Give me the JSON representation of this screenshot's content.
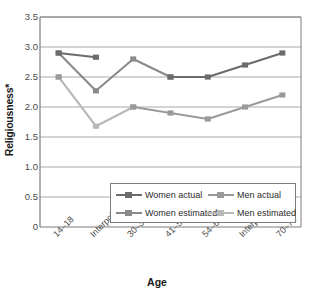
{
  "chart_data": {
    "type": "line",
    "title": "",
    "xlabel": "Age",
    "ylabel": "Religiousness*",
    "categories": [
      "14–18",
      "Interpolated",
      "30–38",
      "41–50",
      "54–61",
      "Interpolated",
      "70–79"
    ],
    "ylim": [
      0,
      3.5
    ],
    "yticks": [
      "3.5",
      "3.0",
      "2.5",
      "2.0",
      "1.5",
      "1.0",
      "0.5",
      "0"
    ],
    "ytick_values": [
      3.5,
      3.0,
      2.5,
      2.0,
      1.5,
      1.0,
      0.5,
      0
    ],
    "grid": "horizontal",
    "legend_position": "inside lower-right",
    "marker": "square",
    "series": [
      {
        "name": "Women actual",
        "color": "#6b6b6b",
        "values": [
          2.9,
          2.83,
          null,
          2.5,
          2.5,
          2.7,
          2.9
        ],
        "segments": [
          {
            "from": 0,
            "to": 1
          },
          {
            "from": 3,
            "to": 4
          },
          {
            "from": 4,
            "to": 5
          },
          {
            "from": 5,
            "to": 6
          }
        ]
      },
      {
        "name": "Men actual",
        "color": "#9a9a9a",
        "values": [
          2.5,
          null,
          2.0,
          1.9,
          1.8,
          2.0,
          2.2
        ],
        "segments": [
          {
            "from": 2,
            "to": 3
          },
          {
            "from": 3,
            "to": 4
          },
          {
            "from": 4,
            "to": 5
          },
          {
            "from": 5,
            "to": 6
          }
        ]
      },
      {
        "name": "Women estimated",
        "color": "#8a8a8a",
        "values": [
          2.9,
          2.27,
          2.8,
          2.5,
          null,
          null,
          null
        ],
        "segments": [
          {
            "from": 0,
            "to": 1
          },
          {
            "from": 1,
            "to": 2
          },
          {
            "from": 2,
            "to": 3
          }
        ]
      },
      {
        "name": "Men estimated",
        "color": "#b8b8b8",
        "values": [
          2.5,
          1.68,
          2.0,
          null,
          null,
          null,
          null
        ],
        "segments": [
          {
            "from": 0,
            "to": 1
          },
          {
            "from": 1,
            "to": 2
          }
        ]
      }
    ],
    "legend": [
      {
        "label": "Women actual",
        "color": "#6b6b6b"
      },
      {
        "label": "Men actual",
        "color": "#9a9a9a"
      },
      {
        "label": "Women estimated",
        "color": "#8a8a8a"
      },
      {
        "label": "Men estimated",
        "color": "#b8b8b8"
      }
    ],
    "axis_color": "#7d7d7d",
    "grid_color": "#a8a8a8"
  }
}
